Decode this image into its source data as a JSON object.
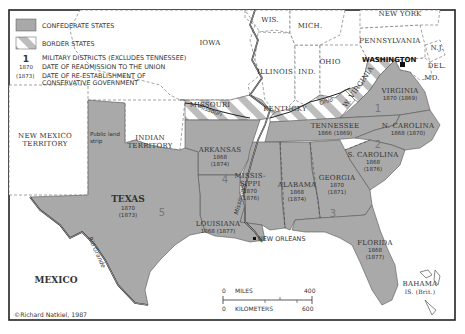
{
  "legend": {
    "confederate": "CONFEDERATE STATES",
    "border": "BORDER STATES",
    "district_num": "1",
    "district_text": "MILITARY DISTRICTS (EXCLUDES TENNESSEE)",
    "readmit_year": "1870",
    "readmit_text": "DATE OF READMISSION TO THE UNION",
    "reest_year": "(1873)",
    "reest_text1": "DATE OF RE-ESTABLISHMENT OF",
    "reest_text2": "CONSERVATIVE GOVERNMENT"
  },
  "colors": {
    "confederate": "#a9a9a9",
    "border_hatch": "#bdbdbd",
    "background": "#ffffff",
    "frame": "#222222"
  },
  "states": {
    "virginia": {
      "name": "VIRGINIA",
      "dates": "1870 (1869)"
    },
    "ncarolina": {
      "name": "N. CAROLINA",
      "dates": "1868 (1870)"
    },
    "scarolina": {
      "name": "S. CAROLINA",
      "readmit": "1868",
      "reest": "(1876)"
    },
    "georgia": {
      "name": "GEORGIA",
      "readmit": "1870",
      "reest": "(1871)"
    },
    "florida": {
      "name": "FLORIDA",
      "readmit": "1868",
      "reest": "(1877)"
    },
    "alabama": {
      "name": "ALABAMA",
      "readmit": "1868",
      "reest": "(1874)"
    },
    "mississippi": {
      "name1": "MISSIS-",
      "name2": "SIPPI",
      "readmit": "1870",
      "reest": "(1876)"
    },
    "louisiana": {
      "name": "LOUISIANA",
      "dates": "1868 (1877)"
    },
    "arkansas": {
      "name": "ARKANSAS",
      "readmit": "1868",
      "reest": "(1874)"
    },
    "texas": {
      "name": "TEXAS",
      "readmit": "1870",
      "reest": "(1873)"
    },
    "tennessee": {
      "name": "TENNESSEE",
      "dates": "1866 (1869)"
    }
  },
  "districts": [
    "1",
    "2",
    "3",
    "4",
    "5"
  ],
  "other_labels": {
    "wis": "WIS.",
    "mich": "MICH.",
    "new_york": "NEW YORK",
    "iowa": "IOWA",
    "pennsylvania": "PENNSYLVANIA",
    "nj": "N.J.",
    "del": "DEL.",
    "md": "MD.",
    "ohio": "OHIO",
    "ind": "IND.",
    "illinois": "ILLINOIS",
    "missouri": "MISSOURI",
    "kentucky": "KENTUCKY",
    "wvirginia": "W. VIRGINIA",
    "washington": "WASHINGTON",
    "nm_territory1": "NEW MEXICO",
    "nm_territory2": "TERRITORY",
    "indian_territory1": "INDIAN",
    "indian_territory2": "TERRITORY",
    "public_land1": "Public land",
    "public_land2": "strip",
    "mexico": "MEXICO",
    "new_orleans": "NEW ORLEANS",
    "bahama1": "BAHAMA",
    "bahama2": "IS. (Brit.)",
    "missouri_river": "Missouri",
    "ohio_river": "Ohio",
    "mississippi_river": "Mississippi",
    "rio_grande": "Rio Grande"
  },
  "scale": {
    "miles_label": "MILES",
    "miles_zero": "0",
    "miles_max": "400",
    "km_label": "KILOMETERS",
    "km_zero": "0",
    "km_max": "600"
  },
  "credit": "©Richard Natkiel, 1987"
}
